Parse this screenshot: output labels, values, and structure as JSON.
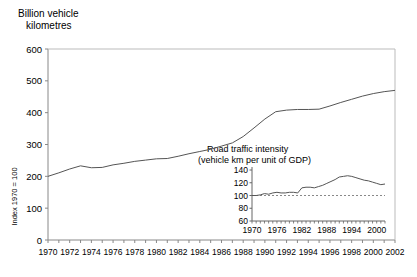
{
  "chart_data": [
    {
      "id": "main",
      "type": "line",
      "title": "Billion vehicle kilometres",
      "title_line1": "Billion vehicle",
      "title_line2": "kilometres",
      "xlabel": "",
      "ylabel": "Billion vehicle kilometres",
      "xlim": [
        1970,
        2002
      ],
      "ylim": [
        0,
        600
      ],
      "yticks": [
        0,
        100,
        200,
        300,
        400,
        500,
        600
      ],
      "xticks": [
        1970,
        1972,
        1974,
        1976,
        1978,
        1980,
        1982,
        1984,
        1986,
        1988,
        1990,
        1992,
        1994,
        1996,
        1998,
        2000,
        2002
      ],
      "xticklabels": [
        "1970",
        "1972",
        "1974",
        "1976",
        "1978",
        "1980",
        "1982",
        "1984",
        "1986",
        "1988",
        "1990",
        "1992",
        "1994",
        "1996",
        "1998",
        "2000",
        "2002"
      ],
      "yticklabels": [
        "0",
        "100",
        "200",
        "300",
        "400",
        "500",
        "600"
      ],
      "grid": false,
      "legend": false,
      "line_color": "#555555",
      "x": [
        1970,
        1971,
        1972,
        1973,
        1974,
        1975,
        1976,
        1977,
        1978,
        1979,
        1980,
        1981,
        1982,
        1983,
        1984,
        1985,
        1986,
        1987,
        1988,
        1989,
        1990,
        1991,
        1992,
        1993,
        1994,
        1995,
        1996,
        1997,
        1998,
        1999,
        2000,
        2001,
        2002
      ],
      "values": [
        200,
        211,
        223,
        233,
        227,
        228,
        236,
        241,
        247,
        251,
        255,
        256,
        263,
        271,
        278,
        285,
        295,
        305,
        325,
        352,
        380,
        403,
        408,
        410,
        410,
        411,
        421,
        432,
        442,
        452,
        460,
        466,
        470,
        485
      ]
    },
    {
      "id": "inset",
      "type": "line",
      "title": "Road traffic intensity (vehicle km per unit of GDP)",
      "title_line1": "Road traffic intensity",
      "title_line2": "(vehicle km per unit of GDP)",
      "ylabel": "Index 1970 = 100",
      "xlabel": "",
      "xlim": [
        1970,
        2002
      ],
      "ylim": [
        60,
        140
      ],
      "yticks": [
        60,
        80,
        100,
        120,
        140
      ],
      "yticklabels": [
        "60",
        "80",
        "100",
        "120",
        "140"
      ],
      "xticks": [
        1970,
        1976,
        1982,
        1988,
        1994,
        2000
      ],
      "xticklabels": [
        "1970",
        "1976",
        "1982",
        "1988",
        "1994",
        "2000"
      ],
      "reference_line": 100,
      "reference_line_style": "dashed",
      "grid": false,
      "legend": false,
      "line_color": "#555555",
      "x": [
        1970,
        1971,
        1972,
        1973,
        1974,
        1975,
        1976,
        1977,
        1978,
        1979,
        1980,
        1981,
        1982,
        1983,
        1984,
        1985,
        1986,
        1987,
        1988,
        1989,
        1990,
        1991,
        1992,
        1993,
        1994,
        1995,
        1996,
        1997,
        1998,
        1999,
        2000,
        2001,
        2002
      ],
      "values": [
        100,
        100,
        101,
        103,
        102,
        104,
        105,
        104,
        104,
        105,
        105,
        104,
        112,
        113,
        113,
        112,
        114,
        116,
        119,
        122,
        125,
        129,
        130,
        131,
        130,
        128,
        126,
        124,
        123,
        121,
        119,
        117,
        118
      ]
    }
  ]
}
